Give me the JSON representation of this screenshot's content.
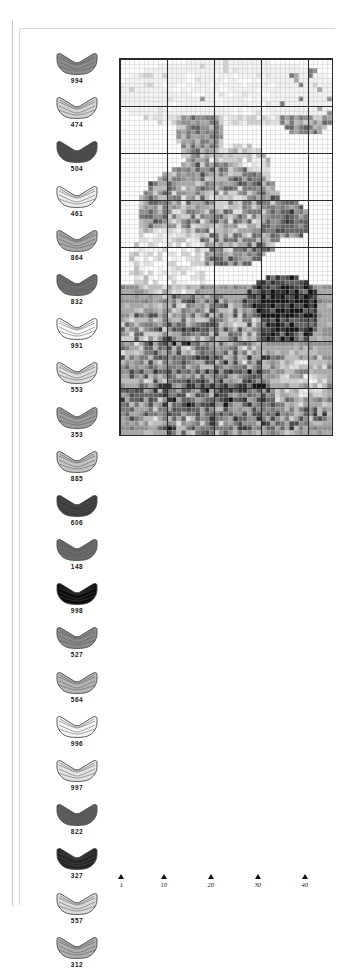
{
  "document": {
    "kind": "cross-stitch-pattern-chart",
    "title": "Cross Stitch Pattern Chart"
  },
  "legend": {
    "name": "thread-color-legend",
    "items": [
      {
        "code": "994",
        "icon": "thread-skein-icon",
        "color": "#8c8c8c"
      },
      {
        "code": "474",
        "icon": "thread-skein-icon",
        "color": "#d2d2d2"
      },
      {
        "code": "504",
        "icon": "thread-skein-icon",
        "color": "#4a4a4a"
      },
      {
        "code": "461",
        "icon": "thread-skein-icon",
        "color": "#ececec"
      },
      {
        "code": "864",
        "icon": "thread-skein-icon",
        "color": "#a9a9a9"
      },
      {
        "code": "832",
        "icon": "thread-skein-icon",
        "color": "#6f6f6f"
      },
      {
        "code": "991",
        "icon": "thread-skein-icon",
        "color": "#fbfbfb"
      },
      {
        "code": "553",
        "icon": "thread-skein-icon",
        "color": "#dcdcdc"
      },
      {
        "code": "353",
        "icon": "thread-skein-icon",
        "color": "#9d9d9d"
      },
      {
        "code": "885",
        "icon": "thread-skein-icon",
        "color": "#c4c4c4"
      },
      {
        "code": "606",
        "icon": "thread-skein-icon",
        "color": "#3d3d3d"
      },
      {
        "code": "148",
        "icon": "thread-skein-icon",
        "color": "#6a6a6a"
      },
      {
        "code": "998",
        "icon": "thread-skein-icon",
        "color": "#0b0b0b"
      },
      {
        "code": "527",
        "icon": "thread-skein-icon",
        "color": "#8a8a8a"
      },
      {
        "code": "564",
        "icon": "thread-skein-icon",
        "color": "#b5b5b5"
      },
      {
        "code": "996",
        "icon": "thread-skein-icon",
        "color": "#f4f4f4"
      },
      {
        "code": "997",
        "icon": "thread-skein-icon",
        "color": "#e3e3e3"
      },
      {
        "code": "822",
        "icon": "thread-skein-icon",
        "color": "#5c5c5c"
      },
      {
        "code": "327",
        "icon": "thread-skein-icon",
        "color": "#262626"
      },
      {
        "code": "557",
        "icon": "thread-skein-icon",
        "color": "#d9d9d9"
      },
      {
        "code": "312",
        "icon": "thread-skein-icon",
        "color": "#aeaeae"
      }
    ]
  },
  "axis": {
    "name": "column-number-axis",
    "ticks": [
      {
        "label": "1",
        "column": 1
      },
      {
        "label": "10",
        "column": 10
      },
      {
        "label": "20",
        "column": 20
      },
      {
        "label": "30",
        "column": 30
      },
      {
        "label": "40",
        "column": 40
      }
    ]
  },
  "chart_data": {
    "type": "heatmap",
    "title": "",
    "xlabel": "",
    "ylabel": "",
    "grid": true,
    "legend_position": "left",
    "columns": 45,
    "rows": 80,
    "cell_px": 4.7,
    "bold_every": 10,
    "grid_color": "#c0c0c0",
    "bold_grid_color": "#2b2b2b",
    "palette": [
      "#ffffff",
      "#f2f2f2",
      "#e2e2e2",
      "#d0d0d0",
      "#bcbcbc",
      "#a6a6a6",
      "#909090",
      "#7a7a7a",
      "#636363",
      "#4c4c4c",
      "#333333",
      "#141414"
    ],
    "field_seed": 20240517,
    "regions": [
      {
        "name": "sky-top-light",
        "x0": 0,
        "y0": 0,
        "x1": 45,
        "y1": 14,
        "level": 1,
        "variance": 1
      },
      {
        "name": "upper-right-shade",
        "x0": 33,
        "y0": 2,
        "x1": 45,
        "y1": 16,
        "level": 5,
        "variance": 2
      },
      {
        "name": "ear-left",
        "x0": 12,
        "y0": 8,
        "x1": 22,
        "y1": 22,
        "level": 6,
        "variance": 2
      },
      {
        "name": "brow-highlight",
        "x0": 18,
        "y0": 18,
        "x1": 32,
        "y1": 30,
        "level": 2,
        "variance": 2
      },
      {
        "name": "face-mid",
        "x0": 4,
        "y0": 22,
        "x1": 34,
        "y1": 44,
        "level": 5,
        "variance": 3
      },
      {
        "name": "muzzle-light",
        "x0": 2,
        "y0": 36,
        "x1": 18,
        "y1": 50,
        "level": 1,
        "variance": 2
      },
      {
        "name": "eye-dark",
        "x0": 30,
        "y0": 30,
        "x1": 40,
        "y1": 38,
        "level": 8,
        "variance": 2
      },
      {
        "name": "nose-shadow",
        "x0": 26,
        "y0": 46,
        "x1": 42,
        "y1": 60,
        "level": 10,
        "variance": 2
      },
      {
        "name": "chest-fur",
        "x0": 0,
        "y0": 50,
        "x1": 30,
        "y1": 70,
        "level": 6,
        "variance": 3
      },
      {
        "name": "lower-body",
        "x0": 0,
        "y0": 62,
        "x1": 45,
        "y1": 80,
        "level": 7,
        "variance": 3
      },
      {
        "name": "right-light-band",
        "x0": 32,
        "y0": 62,
        "x1": 45,
        "y1": 74,
        "level": 3,
        "variance": 2
      }
    ]
  }
}
